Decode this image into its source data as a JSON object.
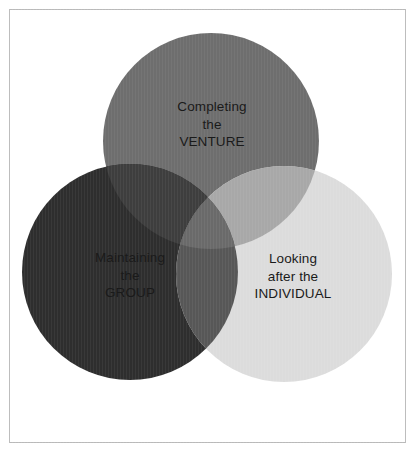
{
  "diagram": {
    "type": "venn",
    "kind": "three-circle-venn-diagram",
    "background_color": "#ffffff",
    "frame": {
      "border_color": "#b9b9b9",
      "x": 9,
      "y": 9,
      "width": 397,
      "height": 434
    },
    "text_color": "#1a1a1a",
    "circles": [
      {
        "id": "venture",
        "name": "completing-the-venture",
        "cx": 211,
        "cy": 141,
        "r": 108,
        "color": "#6e6e6e",
        "lines": [
          "Completing",
          "the",
          "VENTURE"
        ]
      },
      {
        "id": "group",
        "name": "maintaining-the-group",
        "cx": 130,
        "cy": 272,
        "r": 108,
        "color": "#2e2e2e",
        "lines": [
          "Maintaining",
          "the",
          "GROUP"
        ]
      },
      {
        "id": "individual",
        "name": "looking-after-the-individual",
        "cx": 284,
        "cy": 274,
        "r": 108,
        "color": "#dcdcdc",
        "lines": [
          "Looking",
          "after the",
          "INDIVIDUAL"
        ]
      }
    ],
    "overlaps": {
      "group_venture": "#3e3e3e",
      "venture_individual": "#a8a8a8",
      "group_individual": "#575757",
      "all_three": "#6a6a6a"
    }
  }
}
